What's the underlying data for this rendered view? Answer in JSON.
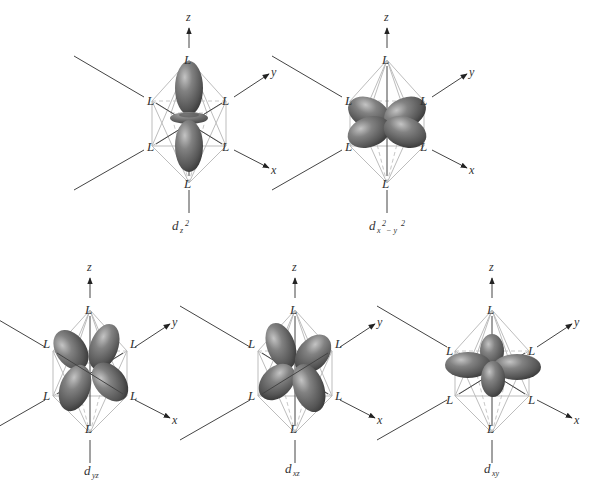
{
  "figure": {
    "ligand_label": "L",
    "axis_labels": {
      "x": "x",
      "y": "y",
      "z": "z"
    },
    "colors": {
      "orbital_fill": "#6e6e6e",
      "orbital_highlight": "#bcbcbc",
      "orbital_shadow": "#3a3a3a",
      "octahedron_edges": "#bdbdbd",
      "axes": "#444444",
      "text": "#333333"
    },
    "panels": [
      {
        "id": "dz2",
        "caption_main": "d",
        "caption_sub": "z",
        "caption_sup": "2",
        "caption_text": "dz2"
      },
      {
        "id": "dx2-y2",
        "caption_main": "d",
        "caption_sub": "x",
        "caption_sup": "2",
        "caption_sub2": " − y",
        "caption_sup2": "2",
        "caption_text": "dx2 − y2"
      },
      {
        "id": "dyz",
        "caption_main": "d",
        "caption_sub": "yz",
        "caption_text": "dyz"
      },
      {
        "id": "dxz",
        "caption_main": "d",
        "caption_sub": "xz",
        "caption_text": "dxz"
      },
      {
        "id": "dxy",
        "caption_main": "d",
        "caption_sub": "xy",
        "caption_text": "dxy"
      }
    ]
  }
}
